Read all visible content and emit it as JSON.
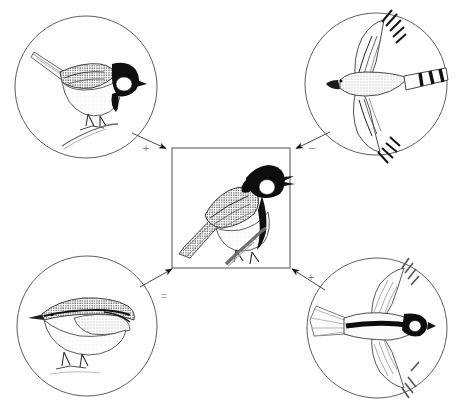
{
  "figure": {
    "type": "concept-diagram",
    "title": "",
    "background_color": "#ffffff",
    "line_color": "#555555",
    "ink_color": "#1a1a1a",
    "width": 456,
    "height": 412
  },
  "center": {
    "name": "great-tit-perched",
    "shape": "square",
    "caption": "",
    "subject": "great tit perched on twig",
    "box": {
      "x": 172,
      "y": 148,
      "w": 118,
      "h": 120
    },
    "border_color": "#6b6b6b"
  },
  "nodes": [
    {
      "id": "top-left",
      "name": "coal-tit-perched",
      "subject": "tit perched on branch",
      "shape": "circle",
      "caption": "",
      "center": {
        "cx": 86,
        "cy": 87
      },
      "radius": 71
    },
    {
      "id": "top-right",
      "name": "sparrowhawk-flying",
      "subject": "sparrowhawk in flight",
      "shape": "circle",
      "caption": "",
      "center": {
        "cx": 376,
        "cy": 84
      },
      "radius": 71
    },
    {
      "id": "bottom-left",
      "name": "nuthatch-perched",
      "subject": "nuthatch standing",
      "shape": "circle",
      "caption": "",
      "center": {
        "cx": 87,
        "cy": 326
      },
      "radius": 70
    },
    {
      "id": "bottom-right",
      "name": "great-tit-flying",
      "subject": "great tit in flight",
      "shape": "circle",
      "caption": "",
      "center": {
        "cx": 377,
        "cy": 328
      },
      "radius": 70
    }
  ],
  "arrows": [
    {
      "id": "arrow-top-left",
      "name": "arrow-from-coal-tit",
      "from": "top-left",
      "to": "center",
      "sign": "+",
      "sign_label": "plus",
      "sign_pos": {
        "x": 146,
        "y": 148
      },
      "path": {
        "x1": 132,
        "y1": 133,
        "x2": 169,
        "y2": 150
      }
    },
    {
      "id": "arrow-top-right",
      "name": "arrow-from-sparrowhawk",
      "from": "top-right",
      "to": "center",
      "sign": "–",
      "sign_label": "minus",
      "sign_pos": {
        "x": 312,
        "y": 147
      },
      "path": {
        "x1": 330,
        "y1": 132,
        "x2": 293,
        "y2": 150
      }
    },
    {
      "id": "arrow-bottom-left",
      "name": "arrow-from-nuthatch",
      "from": "bottom-left",
      "to": "center",
      "sign": "=",
      "sign_label": "equals",
      "sign_pos": {
        "x": 164,
        "y": 296
      },
      "path": {
        "x1": 142,
        "y1": 285,
        "x2": 170,
        "y2": 267
      }
    },
    {
      "id": "arrow-bottom-right",
      "name": "arrow-from-great-tit-flying",
      "from": "bottom-right",
      "to": "center",
      "sign": "+",
      "sign_label": "plus",
      "sign_pos": {
        "x": 311,
        "y": 277
      },
      "path": {
        "x1": 323,
        "y1": 288,
        "x2": 293,
        "y2": 267
      }
    }
  ]
}
